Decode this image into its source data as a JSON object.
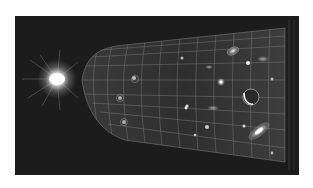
{
  "image": {
    "subject": "expanding universe illustration from big bang",
    "style": "grayscale",
    "background_color": "#1c1c1c",
    "border_color": "#ffffff",
    "elements": [
      {
        "name": "big-bang-flash",
        "x": 57,
        "y": 79
      },
      {
        "name": "spacetime-funnel-grid",
        "from_x": 80,
        "to_x": 285
      },
      {
        "name": "galaxy",
        "x": 233,
        "y": 51
      },
      {
        "name": "galaxy",
        "x": 263,
        "y": 60
      },
      {
        "name": "galaxy",
        "x": 220,
        "y": 82
      },
      {
        "name": "planet",
        "x": 250,
        "y": 98
      },
      {
        "name": "galaxy",
        "x": 259,
        "y": 131
      },
      {
        "name": "galaxy",
        "x": 215,
        "y": 108
      }
    ]
  }
}
